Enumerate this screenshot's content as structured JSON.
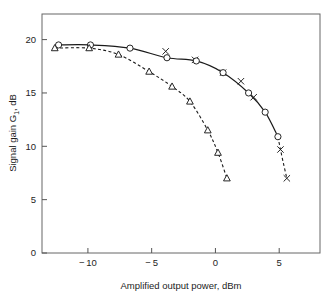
{
  "chart_data": {
    "type": "line",
    "title": "",
    "xlabel": "Amplified output power, dBm",
    "ylabel_main": "Signal gain G",
    "ylabel_sub": "1",
    "ylabel_tail": ", dB",
    "ylabel_full": "Signal gain G1, dB",
    "xlim": [
      -13.6,
      8.2
    ],
    "ylim": [
      0,
      22.4
    ],
    "xticks": [
      -10,
      -5,
      0,
      5
    ],
    "xtick_labels": [
      "-10",
      "-5",
      "0",
      "5"
    ],
    "yticks": [
      0,
      5,
      10,
      15,
      20
    ],
    "ytick_labels": [
      "0",
      "5",
      "10",
      "15",
      "20"
    ],
    "grid": false,
    "legend": "none",
    "series": [
      {
        "name": "upper-curve",
        "linestyle": "solid-then-dashed",
        "markers": [
          "circle",
          "cross"
        ],
        "x": [
          -12.3,
          -9.8,
          -6.7,
          -3.8,
          -1.5,
          0.6,
          2.6,
          3.9,
          4.9
        ],
        "y": [
          19.5,
          19.5,
          19.2,
          18.3,
          18.0,
          16.9,
          15.0,
          13.2,
          10.9
        ],
        "marker_points_circle": [
          {
            "x": -12.3,
            "y": 19.5
          },
          {
            "x": -9.8,
            "y": 19.5
          },
          {
            "x": -6.7,
            "y": 19.2
          },
          {
            "x": -3.8,
            "y": 18.3
          },
          {
            "x": -1.5,
            "y": 18.0
          },
          {
            "x": 0.6,
            "y": 16.9
          },
          {
            "x": 2.6,
            "y": 15.0
          },
          {
            "x": 3.9,
            "y": 13.2
          },
          {
            "x": 4.9,
            "y": 10.9
          }
        ],
        "marker_points_cross": [
          {
            "x": -3.9,
            "y": 18.9
          },
          {
            "x": -1.6,
            "y": 18.1
          },
          {
            "x": 0.6,
            "y": 16.9
          },
          {
            "x": 2.0,
            "y": 16.1
          },
          {
            "x": 3.0,
            "y": 14.6
          },
          {
            "x": 5.1,
            "y": 9.7
          },
          {
            "x": 5.6,
            "y": 7.0
          }
        ]
      },
      {
        "name": "lower-curve",
        "linestyle": "dashed",
        "markers": [
          "triangle"
        ],
        "x": [
          -12.6,
          -9.9,
          -7.6,
          -5.2,
          -3.4,
          -2.0,
          -0.6,
          0.2,
          0.9
        ],
        "y": [
          19.2,
          19.2,
          18.6,
          17.0,
          15.6,
          14.2,
          11.5,
          9.4,
          7.0
        ],
        "marker_points_triangle": [
          {
            "x": -12.6,
            "y": 19.2
          },
          {
            "x": -9.9,
            "y": 19.2
          },
          {
            "x": -7.6,
            "y": 18.6
          },
          {
            "x": -5.2,
            "y": 17.0
          },
          {
            "x": -3.4,
            "y": 15.6
          },
          {
            "x": -2.0,
            "y": 14.2
          },
          {
            "x": -0.6,
            "y": 11.5
          },
          {
            "x": 0.2,
            "y": 9.4
          },
          {
            "x": 0.9,
            "y": 7.0
          }
        ]
      }
    ],
    "colors": {
      "line": "#1a1a1a",
      "axis": "#555555",
      "text": "#1c1c1c",
      "background": "#ffffff"
    }
  }
}
